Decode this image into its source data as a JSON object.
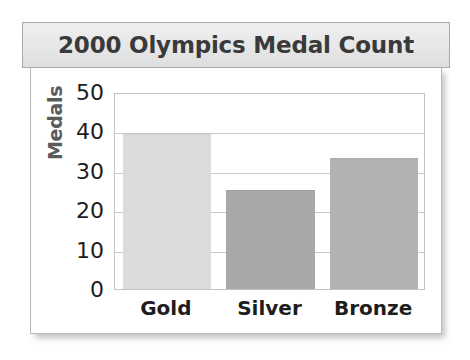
{
  "chart_data": {
    "type": "bar",
    "title": "2000 Olympics Medal Count",
    "xlabel": "",
    "ylabel": "Medals",
    "categories": [
      "Gold",
      "Silver",
      "Bronze"
    ],
    "values": [
      39,
      25,
      33
    ],
    "ylim": [
      0,
      50
    ],
    "ytick_labels": [
      "0",
      "10",
      "20",
      "30",
      "40",
      "50"
    ],
    "ytick_values": [
      0,
      10,
      20,
      30,
      40,
      50
    ],
    "grid": "horizontal",
    "legend": "none",
    "bar_colors": [
      "#dcdcdc",
      "#a8a8a8",
      "#b2b2b2"
    ],
    "bar_border_colors": [
      "#d2d2d2",
      "#a0a0a0",
      "#aaaaaa"
    ]
  },
  "style": {
    "title_color": "#3a3a3a",
    "title_banner_bg": "#e9e9e9",
    "title_banner_border": "#a9a9a9",
    "axis_label_color": "#5b5b5b",
    "tick_color": "#1d1d1d",
    "grid_color": "#c9c9c9",
    "plot_border": "#c2c2c2",
    "card_border": "#b9b9b9",
    "page_bg": "#ffffff"
  }
}
